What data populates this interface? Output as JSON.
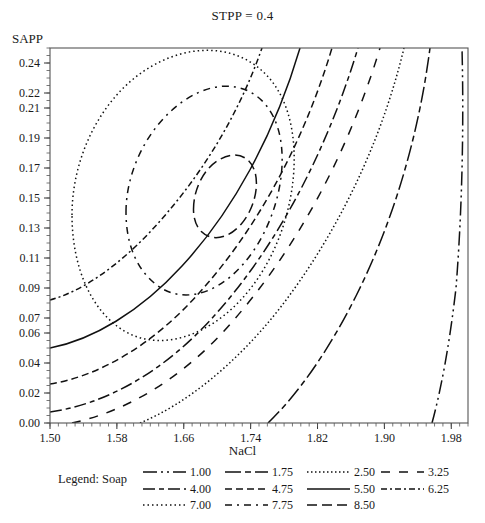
{
  "chart_data": {
    "type": "contour",
    "title": "STPP = 0.4",
    "xlabel": "NaCl",
    "ylabel": "SAPP",
    "xlim": [
      1.5,
      2.0
    ],
    "ylim": [
      0.0,
      0.25
    ],
    "xticks": [
      "1.50",
      "1.58",
      "1.66",
      "1.74",
      "1.82",
      "1.90",
      "1.98"
    ],
    "xtick_values": [
      1.5,
      1.58,
      1.66,
      1.74,
      1.82,
      1.9,
      1.98
    ],
    "yticks": [
      "0.00",
      "0.02",
      "0.04",
      "0.06",
      "0.07",
      "0.09",
      "0.11",
      "0.13",
      "0.15",
      "0.17",
      "0.19",
      "0.21",
      "0.22",
      "0.24"
    ],
    "ytick_values": [
      0.0,
      0.02,
      0.04,
      0.06,
      0.07,
      0.09,
      0.11,
      0.13,
      0.15,
      0.17,
      0.19,
      0.21,
      0.22,
      0.24
    ],
    "grid": false,
    "legend_position": "below",
    "legend_title": "Legend: Soap",
    "response_variable": "Soap",
    "peak": {
      "x": 1.635,
      "y": 0.128,
      "value": 8.75
    },
    "levels": [
      {
        "label": "1.00",
        "value": 1.0,
        "style": "dash-dot-dot",
        "dasharray": "14,4,2,4,2,4"
      },
      {
        "label": "1.75",
        "value": 1.75,
        "style": "long-dash-dot",
        "dasharray": "16,4,6,4"
      },
      {
        "label": "2.50",
        "value": 2.5,
        "style": "dotted-fine",
        "dasharray": "1.5,2.5"
      },
      {
        "label": "3.25",
        "value": 3.25,
        "style": "wide-dash",
        "dasharray": "9,9"
      },
      {
        "label": "4.00",
        "value": 4.0,
        "style": "dash-dot",
        "dasharray": "12,4,5,4"
      },
      {
        "label": "4.75",
        "value": 4.75,
        "style": "dash",
        "dasharray": "7,4"
      },
      {
        "label": "5.50",
        "value": 5.5,
        "style": "solid",
        "dasharray": "none"
      },
      {
        "label": "6.25",
        "value": 6.25,
        "style": "dash-dot-short",
        "dasharray": "6,3,2,3"
      },
      {
        "label": "7.00",
        "value": 7.0,
        "style": "dotted",
        "dasharray": "1.5,3"
      },
      {
        "label": "7.75",
        "value": 7.75,
        "style": "dash-dot-sparse",
        "dasharray": "7,5,2,5"
      },
      {
        "label": "8.50",
        "value": 8.5,
        "style": "medium-dash",
        "dasharray": "10,5"
      }
    ],
    "contours": [
      {
        "value": 8.5,
        "closed": true,
        "center": [
          1.635,
          0.128
        ],
        "radii": [
          0.038,
          0.051
        ],
        "rotation": -28,
        "points": "M 193.5,209.3 C 193.5,188.8 204.0,168.3 219.5,159.5 C 235.0,150.7 249.5,155.4 254.6,170.9 C 259.7,186.4 253.9,209.8 240.9,224.4 C 227.9,239.0 211.4,241.9 201.0,231.3 C 195.9,226.1 193.5,218.1 193.5,209.3 Z"
      },
      {
        "value": 7.75,
        "closed": true,
        "center": [
          1.645,
          0.125
        ],
        "radii": [
          0.075,
          0.098
        ],
        "rotation": -28,
        "points": "M 126.0,212.0 C 126.0,170.0 149.0,124.0 185.0,100.0 C 221.0,76.0 258.0,84.0 274.0,118.0 C 290.0,152.0 282.0,208.0 254.0,250.0 C 226.0,292.0 186.0,306.0 158.0,286.0 C 136.0,270.0 126.0,243.0 126.0,212.0 Z"
      },
      {
        "value": 7.0,
        "closed": true,
        "center": [
          1.655,
          0.122
        ],
        "radii": [
          0.108,
          0.14
        ],
        "rotation": -28,
        "points": "M 72.0,215.0 C 72.0,155.0 103.0,94.0 152.0,66.0 C 201.0,38.0 254.0,48.0 279.0,92.0 C 304.0,136.0 298.0,214.0 262.0,272.0 C 226.0,330.0 168.0,355.0 126.0,332.0 C 92.0,313.0 72.0,268.0 72.0,215.0 Z"
      },
      {
        "value": 6.25,
        "closed": false,
        "points": "M 50.0,300.0 C 80.0,292.0 116.0,268.0 150.0,232.0 C 196.0,183.0 236.0,122.0 262.0,48.0"
      },
      {
        "value": 5.5,
        "closed": false,
        "points": "M 50.0,348.0 C 92.0,340.0 140.0,312.0 182.0,266.0 C 232.0,212.0 274.0,136.0 300.0,48.0"
      },
      {
        "value": 4.75,
        "closed": false,
        "points": "M 50.0,384.0 C 100.0,376.0 154.0,344.0 200.0,292.0 C 254.0,232.0 302.0,148.0 332.0,48.0"
      },
      {
        "value": 4.0,
        "closed": false,
        "points": "M 50.0,412.0 C 106.0,404.0 164.0,372.0 214.0,316.0 C 272.0,252.0 324.0,160.0 358.0,48.0"
      },
      {
        "value": 3.25,
        "closed": false,
        "points": "M 72.0,423.0 C 124.0,412.0 182.0,380.0 232.0,322.0 C 292.0,254.0 346.0,160.0 380.0,48.0"
      },
      {
        "value": 2.5,
        "closed": false,
        "points": "M 140.0,423.0 C 186.0,404.0 236.0,364.0 280.0,308.0 C 334.0,238.0 380.0,148.0 404.0,48.0"
      },
      {
        "value": 1.75,
        "closed": false,
        "points": "M 268.0,423.0 C 300.0,392.0 330.0,348.0 356.0,296.0 C 392.0,224.0 418.0,140.0 430.0,48.0"
      },
      {
        "value": 1.0,
        "closed": false,
        "points": "M 432.0,423.0 C 442.0,386.0 450.0,340.0 456.0,288.0 C 462.0,212.0 464.0,128.0 462.0,48.0"
      }
    ]
  },
  "legend": {
    "title": "Legend: Soap",
    "rows": [
      [
        "1.00",
        "1.75",
        "2.50",
        "3.25"
      ],
      [
        "4.00",
        "4.75",
        "5.50",
        "6.25"
      ],
      [
        "7.00",
        "7.75",
        "8.50"
      ]
    ]
  }
}
